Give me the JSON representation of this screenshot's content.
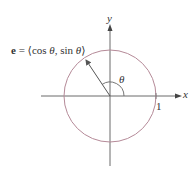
{
  "diagram": {
    "type": "unit-circle",
    "labels": {
      "vector_symbol": "e",
      "vector_eq": " = ⟨cos ",
      "theta1": "θ",
      "comma_sin": ", sin ",
      "theta2": "θ",
      "close": "⟩",
      "angle": "θ",
      "x_axis": "x",
      "y_axis": "y",
      "radius_tick": "1"
    },
    "geometry": {
      "origin": [
        110,
        96
      ],
      "radius": 46,
      "vector_tip": [
        85,
        58
      ]
    },
    "colors": {
      "circle": "#b58a98",
      "axes": "#6a6a6a",
      "vector": "#555555",
      "text": "#333333"
    }
  }
}
